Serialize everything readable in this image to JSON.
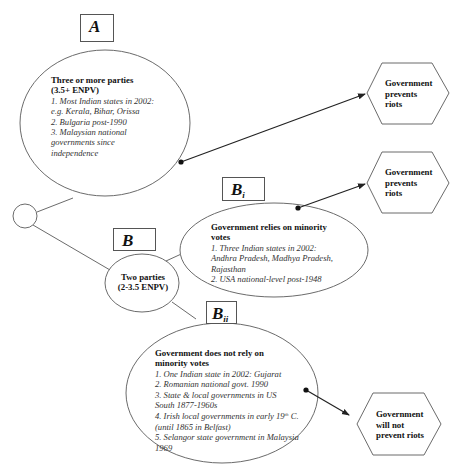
{
  "diagram": {
    "root": {
      "shape": "circle",
      "label": ""
    },
    "branch_a": {
      "tag": "A",
      "title": "Three or more parties (3.5+ ENPV)",
      "title_line1": "Three or more parties",
      "title_line2": "(3.5+ ENPV)",
      "items": [
        "1. Most Indian states  in 2002:",
        "e.g. Kerala, Bihar, Orissa",
        "2. Bulgaria post-1990",
        "3. Malaysian national",
        "governments since",
        "independence"
      ],
      "outcome": [
        "Government",
        "prevents",
        "riots"
      ]
    },
    "branch_b": {
      "tag": "B",
      "title_line1": "Two parties",
      "title_line2": "(2-3.5 ENPV)"
    },
    "branch_bi": {
      "tag": "B",
      "tag_sub": "i",
      "title_line1": "Government relies on minority",
      "title_line2": "votes",
      "items": [
        "1. Three Indian states in 2002:",
        "Andhra Pradesh, Madhya Pradesh,",
        "Rajasthan",
        "2.  USA national-level post-1948"
      ],
      "outcome": [
        "Government",
        "prevents",
        "riots"
      ]
    },
    "branch_bii": {
      "tag": "B",
      "tag_sub": "ii",
      "title_line1": "Government does not rely on",
      "title_line2": "minority votes",
      "items": [
        "1. One Indian state in 2002: Gujarat",
        "2. Romanian national govt. 1990",
        "3. State & local governments in US",
        "South 1877-1960s",
        "4. Irish local governments in early 19",
        "th",
        " C.",
        "(until 1865 in Belfast)",
        "5. Selangor state government in Malaysia",
        "1969"
      ],
      "outcome": [
        "Government",
        "will not",
        "prevent riots"
      ]
    },
    "colors": {
      "stroke": "#6b6b6b",
      "arrow": "#222222",
      "text": "#111111",
      "italic_text": "#333333",
      "background": "#ffffff"
    }
  }
}
